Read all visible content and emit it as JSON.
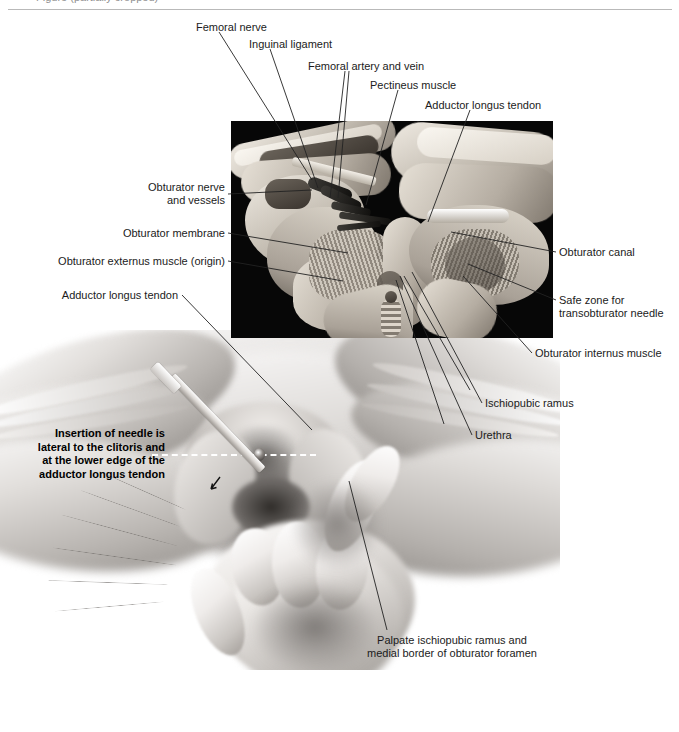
{
  "figure": {
    "type": "anatomical-illustration",
    "header_clipped_text": "Figure (partially cropped)",
    "panels": {
      "top_panel": "cadaveric pelvis dissection photograph on black background",
      "bottom_panel": "grayscale line-and-tone drawing of female perineum with clinician's hand and needle"
    }
  },
  "labels_top": [
    {
      "id": "femoral-nerve",
      "text": "Femoral nerve",
      "x": 196,
      "y": 21,
      "align": "left"
    },
    {
      "id": "inguinal-ligament",
      "text": "Inguinal ligament",
      "x": 249,
      "y": 38,
      "align": "left"
    },
    {
      "id": "femoral-artery-vein",
      "text": "Femoral artery and vein",
      "x": 308,
      "y": 60,
      "align": "left"
    },
    {
      "id": "pectineus-muscle",
      "text": "Pectineus muscle",
      "x": 370,
      "y": 79,
      "align": "left"
    },
    {
      "id": "adductor-longus-tendon-top",
      "text": "Adductor longus tendon",
      "x": 425,
      "y": 99,
      "align": "left"
    }
  ],
  "labels_left": [
    {
      "id": "obturator-nerve-vessels",
      "text": "Obturator nerve\nand vessels",
      "x": 135,
      "y": 181,
      "align": "right",
      "w": 90
    },
    {
      "id": "obturator-membrane",
      "text": "Obturator membrane",
      "x": 110,
      "y": 227,
      "align": "right",
      "w": 115
    },
    {
      "id": "obturator-externus",
      "text": "Obturator externus muscle (origin)",
      "x": 45,
      "y": 255,
      "align": "right",
      "w": 180
    },
    {
      "id": "adductor-longus-tendon-left",
      "text": "Adductor longus tendon",
      "x": 45,
      "y": 289,
      "align": "right",
      "w": 133
    }
  ],
  "labels_right": [
    {
      "id": "obturator-canal",
      "text": "Obturator canal",
      "x": 559,
      "y": 246,
      "align": "left"
    },
    {
      "id": "safe-zone",
      "text": "Safe zone for\ntransobturator needle",
      "x": 559,
      "y": 294,
      "align": "left"
    },
    {
      "id": "obturator-internus",
      "text": "Obturator internus muscle",
      "x": 535,
      "y": 347,
      "align": "left"
    },
    {
      "id": "ischiopubic-ramus",
      "text": "Ischiopubic ramus",
      "x": 485,
      "y": 397,
      "align": "left"
    },
    {
      "id": "urethra",
      "text": "Urethra",
      "x": 475,
      "y": 429,
      "align": "left"
    }
  ],
  "callout_bold": {
    "id": "needle-insertion-instruction",
    "text": "Insertion of needle is\nlateral to the clitoris and\nat the lower edge of the\nadductor longus tendon",
    "x": 25,
    "y": 427,
    "width": 140
  },
  "caption_bottom": {
    "id": "palpate-caption",
    "text": "Palpate ischiopubic ramus and\nmedial border of obturator foramen",
    "x": 357,
    "y": 634,
    "width": 190
  },
  "annotations": {
    "dashed_guide_line": "white dashed horizontal guide at lower edge of adductor longus tendon",
    "needle_arrow": "small black arrow indicating needle direction",
    "clitoris_marker": "dark dot marking the clitoris"
  },
  "colors": {
    "page_background": "#ffffff",
    "photo_background": "#070707",
    "text": "#1b1b1b",
    "leader_line": "#222222",
    "rule": "#b9b9b9",
    "dashed_guide": "#ffffff"
  }
}
